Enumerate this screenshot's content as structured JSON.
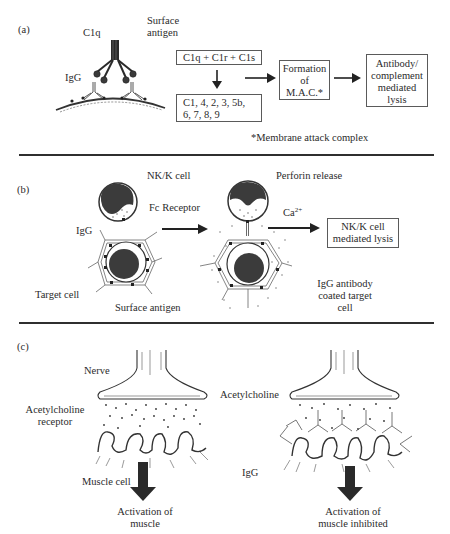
{
  "panel_a": {
    "label": "(a)",
    "c1q_label": "C1q",
    "surface_antigen_label_1": "Surface",
    "surface_antigen_label_2": "antigen",
    "igg_label": "IgG",
    "box_c1qrs": "C1q + C1r + C1s",
    "box_components_line1": "C1, 4, 2, 3, 5b,",
    "box_components_line2": "6, 7, 8, 9",
    "box_mac_line1": "Formation",
    "box_mac_line2": "of",
    "box_mac_line3": "M.A.C.*",
    "box_lysis_line1": "Antibody/",
    "box_lysis_line2": "complement",
    "box_lysis_line3": "mediated",
    "box_lysis_line4": "lysis",
    "footnote": "*Membrane attack complex"
  },
  "panel_b": {
    "label": "(b)",
    "nk_cell_label": "NK/K cell",
    "perforin_label": "Perforin release",
    "fc_receptor_label": "Fc Receptor",
    "igg_label": "IgG",
    "calcium_label": "Ca",
    "calcium_sup": "2+",
    "box_lysis_line1": "NK/K cell",
    "box_lysis_line2": "mediated lysis",
    "target_cell_label": "Target cell",
    "surface_antigen_label": "Surface antigen",
    "coated_line1": "IgG antibody",
    "coated_line2": "coated target",
    "coated_line3": "cell"
  },
  "panel_c": {
    "label": "(c)",
    "nerve_label": "Nerve",
    "ach_receptor_line1": "Acetylcholine",
    "ach_receptor_line2": "receptor",
    "acetylcholine_label": "Acetylcholine",
    "muscle_cell_label": "Muscle cell",
    "igg_label": "IgG",
    "activation_line1": "Activation of",
    "activation_line2": "muscle",
    "inhibited_line1": "Activation of",
    "inhibited_line2": "muscle inhibited"
  },
  "colors": {
    "ink": "#2b2b2b",
    "nucleus": "#3a3a3a",
    "divider": "#2f2f2f"
  }
}
